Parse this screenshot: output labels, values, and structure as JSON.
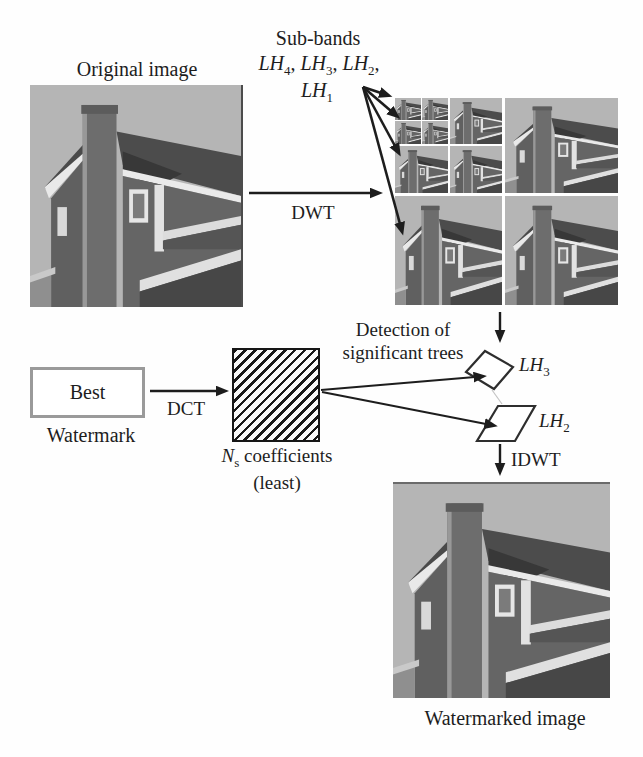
{
  "figure": {
    "kind": "watermark-embedding-flow-diagram"
  },
  "labels": {
    "original_image": "Original image",
    "subbands_title": "Sub-bands",
    "dwt": "DWT",
    "detection_line1": "Detection of",
    "detection_line2": "significant trees",
    "idwt": "IDWT",
    "best": "Best",
    "watermark": "Watermark",
    "dct": "DCT",
    "least": "(least)",
    "watermarked_image": "Watermarked image"
  },
  "rich": {
    "subband_line1": [
      "LH",
      "4",
      ", ",
      "LH",
      "3",
      ", ",
      "LH",
      "2",
      ","
    ],
    "subband_line2": [
      "LH",
      "1"
    ],
    "lh3": [
      "LH",
      "3"
    ],
    "lh2": [
      "LH",
      "2"
    ],
    "ns": [
      "N",
      "s",
      " coefficients"
    ]
  },
  "images": {
    "original": "grayscale house photograph",
    "dwt_decomposition": "DWT sub-band pyramid of house photograph",
    "watermarked": "grayscale watermarked house photograph"
  },
  "colors": {
    "text": "#1d1d1d",
    "arrows": "#1d1d1d",
    "hatch_lines": "#161616",
    "best_box_border": "#9a9a9a",
    "house_sky": "#b5b5b5",
    "house_wall": "#656565",
    "house_roof": "#4c4c4c"
  }
}
